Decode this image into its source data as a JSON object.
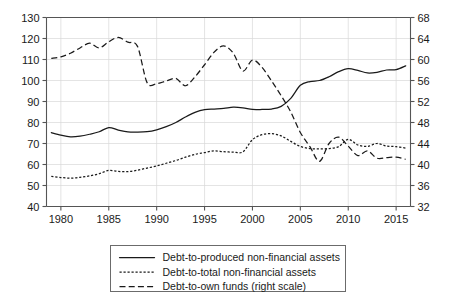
{
  "chart_data": {
    "type": "line",
    "title": "",
    "subtitle": "",
    "xlabel": "",
    "ylabel": "",
    "y2label": "",
    "grid": true,
    "legend_position": "bottom",
    "xlim": [
      1978.5,
      2016.5
    ],
    "ylim": [
      40,
      130
    ],
    "y2lim": [
      32,
      68
    ],
    "x_ticks": [
      1980,
      1985,
      1990,
      1995,
      2000,
      2005,
      2010,
      2015
    ],
    "x_tick_labels": [
      "1980",
      "1985",
      "1990",
      "1995",
      "2000",
      "2005",
      "2010",
      "2015"
    ],
    "y_ticks": [
      40,
      50,
      60,
      70,
      80,
      90,
      100,
      110,
      120,
      130
    ],
    "y_tick_labels": [
      "40",
      "50",
      "60",
      "70",
      "80",
      "90",
      "100",
      "110",
      "120",
      "130"
    ],
    "y2_ticks": [
      32,
      36,
      40,
      44,
      48,
      52,
      56,
      60,
      64,
      68
    ],
    "y2_tick_labels": [
      "32",
      "36",
      "40",
      "44",
      "48",
      "52",
      "56",
      "60",
      "64",
      "68"
    ],
    "x": [
      1979,
      1980,
      1981,
      1982,
      1983,
      1984,
      1985,
      1986,
      1987,
      1988,
      1989,
      1990,
      1991,
      1992,
      1993,
      1994,
      1995,
      1996,
      1997,
      1998,
      1999,
      2000,
      2001,
      2002,
      2003,
      2004,
      2005,
      2006,
      2007,
      2008,
      2009,
      2010,
      2011,
      2012,
      2013,
      2014,
      2015,
      2016
    ],
    "series": [
      {
        "name": "Debt-to-produced non-financial assets",
        "style": "solid",
        "axis": "left",
        "values": [
          75.2,
          74.0,
          73.2,
          73.5,
          74.4,
          75.6,
          77.6,
          76.4,
          75.5,
          75.4,
          75.6,
          76.5,
          78.0,
          80.0,
          82.6,
          84.8,
          86.1,
          86.4,
          86.7,
          87.3,
          87.0,
          86.2,
          86.2,
          86.4,
          87.7,
          91.5,
          97.7,
          99.5,
          100.0,
          101.8,
          104.2,
          105.6,
          104.8,
          103.6,
          103.9,
          105.0,
          105.2,
          107.0
        ]
      },
      {
        "name": "Debt-to-total non-financial assets",
        "style": "dotted",
        "axis": "left",
        "values": [
          54.3,
          53.8,
          53.5,
          53.9,
          54.6,
          55.6,
          57.2,
          56.7,
          56.6,
          57.3,
          58.3,
          59.3,
          60.6,
          61.9,
          63.5,
          64.8,
          65.7,
          66.5,
          66.1,
          65.9,
          66.0,
          71.8,
          74.2,
          74.7,
          73.6,
          71.0,
          68.6,
          67.6,
          67.4,
          67.6,
          68.5,
          72.0,
          69.3,
          68.6,
          70.0,
          68.8,
          68.5,
          67.8
        ]
      },
      {
        "name": "Debt-to-own funds (right scale)",
        "style": "dashed",
        "axis": "right",
        "values": [
          60.2,
          60.5,
          61.2,
          62.2,
          63.1,
          62.2,
          63.4,
          64.2,
          63.3,
          62.5,
          55.6,
          55.4,
          55.9,
          56.4,
          55.0,
          56.7,
          59.0,
          61.4,
          62.6,
          61.2,
          57.8,
          59.9,
          58.5,
          55.9,
          53.1,
          50.0,
          46.1,
          43.4,
          40.6,
          44.0,
          45.2,
          43.5,
          41.7,
          42.6,
          41.2,
          41.3,
          41.4,
          41.0
        ]
      }
    ],
    "right_axis_series_index": 2
  },
  "legend": {
    "items": [
      {
        "label": "Debt-to-produced non-financial assets",
        "style": "solid"
      },
      {
        "label": "Debt-to-total non-financial assets",
        "style": "dotted"
      },
      {
        "label": "Debt-to-own funds (right scale)",
        "style": "dashed"
      }
    ]
  }
}
